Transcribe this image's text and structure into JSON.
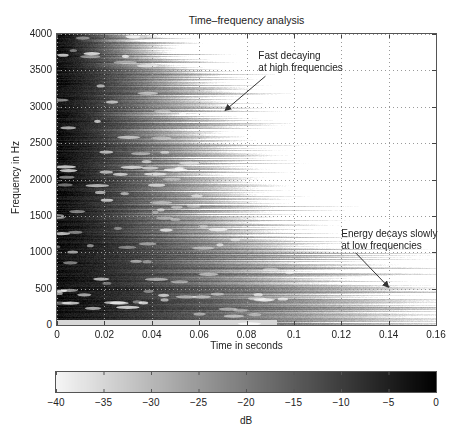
{
  "chart_data": {
    "type": "heatmap",
    "title": "Time–frequency analysis",
    "xlabel": "Time in seconds",
    "ylabel": "Frequency in Hz",
    "xlim": [
      0,
      0.16
    ],
    "ylim": [
      0,
      4000
    ],
    "x_ticks": [
      "0",
      "0.02",
      "0.04",
      "0.06",
      "0.08",
      "0.1",
      "0.12",
      "0.14",
      "0.16"
    ],
    "y_ticks": [
      "0",
      "500",
      "1000",
      "1500",
      "2000",
      "2500",
      "3000",
      "3500",
      "4000"
    ],
    "grid": true,
    "colormap": "gray (white = -40 dB, black = 0 dB)",
    "colorbar": {
      "label": "dB",
      "range": [
        -40,
        0
      ],
      "ticks": [
        "-40",
        "-35",
        "-30",
        "-25",
        "-20",
        "-15",
        "-10",
        "-5",
        "0"
      ],
      "orientation": "horizontal",
      "position": "bottom"
    },
    "decay_envelope": {
      "description": "Approximate time (s) at which energy falls below -40 dB per frequency band",
      "frequency_hz": [
        0,
        250,
        500,
        750,
        1000,
        1250,
        1500,
        2000,
        2500,
        3000,
        3500,
        4000
      ],
      "decay_time_s": [
        0.155,
        0.16,
        0.15,
        0.13,
        0.12,
        0.1,
        0.09,
        0.08,
        0.075,
        0.07,
        0.065,
        0.04
      ]
    },
    "annotations": [
      {
        "text": [
          "Fast decaying",
          "at high frequencies"
        ],
        "text_pos": [
          0.085,
          3700
        ],
        "arrow_from": [
          0.088,
          3420
        ],
        "arrow_to": [
          0.071,
          2950
        ]
      },
      {
        "text": [
          "Energy decays slowly",
          "at low frequencies"
        ],
        "text_pos": [
          0.12,
          1250
        ],
        "arrow_from": [
          0.126,
          995
        ],
        "arrow_to": [
          0.14,
          520
        ]
      }
    ]
  }
}
